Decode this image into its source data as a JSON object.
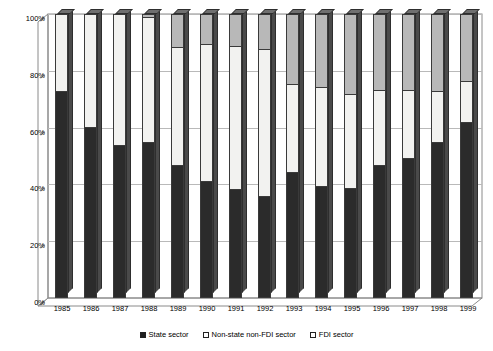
{
  "chart_data": {
    "type": "bar",
    "subtype": "stacked-column-100percent-3d",
    "title": "",
    "xlabel": "",
    "ylabel": "",
    "ylim": [
      0,
      100
    ],
    "yticks": [
      "0%",
      "20%",
      "40%",
      "60%",
      "80%",
      "100%"
    ],
    "ytick_values": [
      0,
      20,
      40,
      60,
      80,
      100
    ],
    "grid": true,
    "legend_position": "bottom",
    "categories": [
      "1985",
      "1986",
      "1987",
      "1988",
      "1989",
      "1990",
      "1991",
      "1992",
      "1993",
      "1994",
      "1995",
      "1996",
      "1997",
      "1998",
      "1999"
    ],
    "series": [
      {
        "name": "State sector",
        "color": "#2b2b2b",
        "values": [
          72.5,
          60.0,
          53.5,
          54.5,
          46.5,
          41.0,
          38.0,
          35.5,
          44.0,
          39.0,
          38.5,
          46.5,
          49.0,
          54.5,
          61.5
        ]
      },
      {
        "name": "Non-state non-FDI sector",
        "color": "#f2f2f0",
        "values": [
          27.5,
          40.0,
          46.5,
          44.0,
          41.5,
          48.0,
          50.5,
          52.0,
          31.0,
          35.0,
          33.0,
          26.5,
          24.0,
          18.0,
          14.5
        ]
      },
      {
        "name": "FDI sector",
        "color": "#b8b8b8",
        "values": [
          0.0,
          0.0,
          0.0,
          1.5,
          12.0,
          11.0,
          11.5,
          12.5,
          25.0,
          26.0,
          28.5,
          27.0,
          27.0,
          27.5,
          24.0
        ]
      }
    ]
  },
  "legend": {
    "items": [
      {
        "label": "State sector",
        "swatch": "state"
      },
      {
        "label": "Non-state non-FDI sector",
        "swatch": "nonstate"
      },
      {
        "label": "FDI sector",
        "swatch": "fdi"
      }
    ]
  }
}
